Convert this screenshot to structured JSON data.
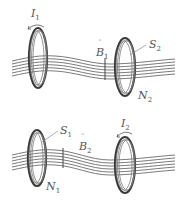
{
  "figure": {
    "panels": [
      {
        "id": "top",
        "labels": {
          "current": {
            "main": "I",
            "sub": "1"
          },
          "field": {
            "main": "B",
            "sub": "1",
            "vector": true
          },
          "area": {
            "main": "S",
            "sub": "2"
          },
          "turns": {
            "main": "N",
            "sub": "2"
          }
        },
        "source_coil": "left",
        "receiving_coil": "right"
      },
      {
        "id": "bottom",
        "labels": {
          "area": {
            "main": "S",
            "sub": "1"
          },
          "field": {
            "main": "B",
            "sub": "2",
            "vector": true
          },
          "current": {
            "main": "I",
            "sub": "2"
          },
          "turns": {
            "main": "N",
            "sub": "1"
          }
        },
        "source_coil": "right",
        "receiving_coil": "left"
      }
    ],
    "field_line_count": 6,
    "colors": {
      "coil": "#3a3a3a",
      "field_lines": "#6b6b6b",
      "labels": "#555555"
    }
  }
}
